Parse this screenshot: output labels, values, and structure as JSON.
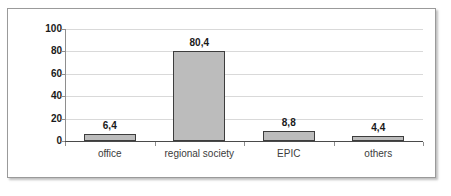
{
  "chart_data": {
    "type": "bar",
    "title": "",
    "subtitle": "",
    "xlabel": "",
    "ylabel": "",
    "categories": [
      "office",
      "regional society",
      "EPIC",
      "others"
    ],
    "values": [
      6.4,
      80.4,
      8.8,
      4.4
    ],
    "value_labels": [
      "6,4",
      "80,4",
      "8,8",
      "4,4"
    ],
    "ylim": [
      0,
      100
    ],
    "ytick_values": [
      0,
      20,
      40,
      60,
      80,
      100
    ],
    "ytick_labels": [
      "0",
      "20",
      "40",
      "60",
      "80",
      "100"
    ],
    "grid": "horizontal",
    "legend": "none",
    "series": [
      {
        "name": "",
        "values": [
          6.4,
          80.4,
          8.8,
          4.4
        ]
      }
    ],
    "colors": {
      "bar_fill": "#bcbcbc",
      "bar_border": "#3d3d3d",
      "gridline": "#d9d9d9",
      "axis": "#8e8e8e",
      "baseline": "#4a4a4a",
      "frame_border": "#9a9a9a",
      "plot_background": "#ffffff",
      "label_text": "#1a1a1a",
      "category_text": "#3c3c3c"
    }
  }
}
